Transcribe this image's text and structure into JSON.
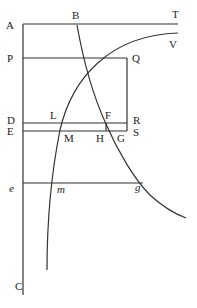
{
  "diagram": {
    "type": "geometric-figure",
    "labels": {
      "A": "A",
      "B": "B",
      "T": "T",
      "V": "V",
      "P": "P",
      "Q": "Q",
      "D": "D",
      "L": "L",
      "F": "F",
      "R": "R",
      "E": "E",
      "M": "M",
      "H": "H",
      "G": "G",
      "S": "S",
      "e": "e",
      "m": "m",
      "g": "g",
      "C": "C"
    },
    "colors": {
      "stroke": "#333333",
      "text": "#222222",
      "background": "#ffffff"
    }
  }
}
